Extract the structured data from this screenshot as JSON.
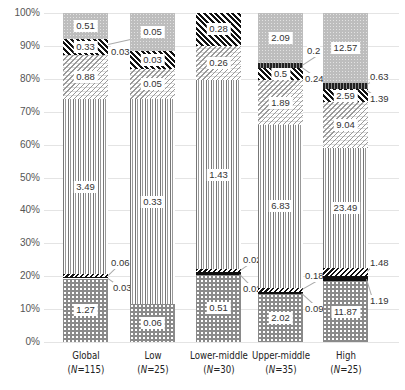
{
  "chart_data": {
    "type": "bar",
    "stacked": true,
    "normalized_percent": true,
    "title": "",
    "xlabel": "",
    "ylabel": "",
    "ylim": [
      0,
      100
    ],
    "y_ticks": [
      "0%",
      "10%",
      "20%",
      "30%",
      "40%",
      "50%",
      "60%",
      "70%",
      "80%",
      "90%",
      "100%"
    ],
    "grid": true,
    "legend": "none",
    "categories": [
      {
        "name": "Global",
        "n": "(N=115)",
        "n_prefix": "(",
        "n_italic": "N",
        "n_suffix": "=115)"
      },
      {
        "name": "Low",
        "n": "(N=25)",
        "n_prefix": "(",
        "n_italic": "N",
        "n_suffix": "=25)"
      },
      {
        "name": "Lower-middle",
        "n": "(N=30)",
        "n_prefix": "(",
        "n_italic": "N",
        "n_suffix": "=30)"
      },
      {
        "name": "Upper-middle",
        "n": "(N=35)",
        "n_prefix": "(",
        "n_italic": "N",
        "n_suffix": "=35)"
      },
      {
        "name": "High",
        "n": "(N=25)",
        "n_prefix": "(",
        "n_italic": "N",
        "n_suffix": "=25)"
      }
    ],
    "series_order_bottom_to_top": [
      "checker",
      "black",
      "thin-diagonal",
      "vertical-lines",
      "light-diagonal",
      "dense-diagonal",
      "dark-vertical",
      "dotted"
    ],
    "series": [
      {
        "name": "checker",
        "pattern": "checker",
        "values": [
          1.27,
          0.06,
          0.51,
          2.02,
          11.87
        ]
      },
      {
        "name": "black",
        "pattern": "solid-black",
        "values": [
          0.03,
          null,
          0.02,
          0.09,
          1.19
        ]
      },
      {
        "name": "thin-diagonal",
        "pattern": "thin-diagonal",
        "values": [
          0.06,
          null,
          0.02,
          0.18,
          1.48
        ]
      },
      {
        "name": "vertical-lines",
        "pattern": "vertical-lines",
        "values": [
          3.49,
          0.33,
          1.43,
          6.83,
          23.49
        ]
      },
      {
        "name": "light-diagonal",
        "pattern": "light-diagonal",
        "values": [
          0.88,
          0.05,
          0.26,
          1.89,
          9.04
        ]
      },
      {
        "name": "dense-diagonal",
        "pattern": "dense-diagonal",
        "values": [
          0.33,
          0.03,
          0.28,
          0.5,
          2.59
        ]
      },
      {
        "name": "dark-vertical",
        "pattern": "dark-vertical",
        "values": [
          null,
          null,
          null,
          0.24,
          1.39
        ]
      },
      {
        "name": "dotted",
        "pattern": "dotted",
        "values": [
          0.51,
          0.05,
          null,
          2.09,
          12.57
        ]
      }
    ],
    "side_annotations": [
      {
        "category": "Global",
        "labels": [
          "0.03",
          "0.06",
          "0.03"
        ]
      },
      {
        "category": "Lower-middle",
        "labels": [
          "0.02",
          "0.02"
        ]
      },
      {
        "category": "Upper-middle",
        "labels": [
          "0.2",
          "0.24",
          "0.18",
          "0.09"
        ]
      },
      {
        "category": "High",
        "labels": [
          "0.63",
          "1.39",
          "1.48",
          "1.19"
        ]
      }
    ]
  },
  "bars": [
    {
      "key": "global",
      "x": 63,
      "label": "Global",
      "n_prefix": "(",
      "n_italic": "N",
      "n_suffix": "=115)",
      "segments": [
        {
          "pattern": "checker",
          "from": 0,
          "to": 19.3,
          "label": "1.27"
        },
        {
          "pattern": "black",
          "from": 19.3,
          "to": 19.8,
          "label": ""
        },
        {
          "pattern": "thindiag",
          "from": 19.8,
          "to": 20.7,
          "label": ""
        },
        {
          "pattern": "vertical",
          "from": 20.7,
          "to": 73.8,
          "label": "3.49"
        },
        {
          "pattern": "lightdiag2",
          "from": 73.8,
          "to": 87.2,
          "label": "0.88"
        },
        {
          "pattern": "densediag",
          "from": 87.2,
          "to": 92.2,
          "label": "0.33"
        },
        {
          "pattern": "dotted",
          "from": 92.2,
          "to": 100,
          "label": "0.51"
        }
      ],
      "sides": [
        {
          "text": "0.03",
          "x": 111,
          "y": 88,
          "lx1": 108,
          "ly1": 90.5,
          "lx2": 130,
          "ly2": 92
        },
        {
          "text": "0.06",
          "x": 111,
          "y": 24,
          "lx1": 108,
          "ly1": 20.5,
          "lx2": 118,
          "ly2": 23.5
        },
        {
          "text": "0.03",
          "x": 113,
          "y": 16.5,
          "lx1": 108,
          "ly1": 19.6,
          "lx2": 118,
          "ly2": 17.5
        }
      ]
    },
    {
      "key": "low",
      "x": 130,
      "label": "Low",
      "n_prefix": "(",
      "n_italic": "N",
      "n_suffix": "=25)",
      "segments": [
        {
          "pattern": "checker",
          "from": 0,
          "to": 11.4,
          "label": "0.06"
        },
        {
          "pattern": "vertical",
          "from": 11.4,
          "to": 73.8,
          "label": "0.33"
        },
        {
          "pattern": "lightdiag2",
          "from": 73.8,
          "to": 83.1,
          "label": "0.05"
        },
        {
          "pattern": "densediag",
          "from": 83.1,
          "to": 88.6,
          "label": "0.03"
        },
        {
          "pattern": "dotted",
          "from": 88.6,
          "to": 100,
          "label": "0.05"
        }
      ],
      "sides": []
    },
    {
      "key": "lower-middle",
      "x": 196,
      "label": "Lower-middle",
      "n_prefix": "(",
      "n_italic": "N",
      "n_suffix": "=30)",
      "segments": [
        {
          "pattern": "checker",
          "from": 0,
          "to": 20.5,
          "label": "0.51"
        },
        {
          "pattern": "black",
          "from": 20.5,
          "to": 21.3,
          "label": ""
        },
        {
          "pattern": "thindiag",
          "from": 21.3,
          "to": 22.1,
          "label": ""
        },
        {
          "pattern": "vertical",
          "from": 22.1,
          "to": 79.6,
          "label": "1.43"
        },
        {
          "pattern": "lightdiag2",
          "from": 79.6,
          "to": 90.0,
          "label": "0.26"
        },
        {
          "pattern": "densediag",
          "from": 90.0,
          "to": 100,
          "label": "0.28"
        }
      ],
      "sides": [
        {
          "text": "0.02",
          "x": 243,
          "y": 25,
          "lx1": 240,
          "ly1": 22,
          "lx2": 252,
          "ly2": 24.5
        },
        {
          "text": "0.02",
          "x": 243,
          "y": 16,
          "lx1": 240,
          "ly1": 20.8,
          "lx2": 252,
          "ly2": 17
        }
      ]
    },
    {
      "key": "upper-middle",
      "x": 258,
      "label": "Upper-middle",
      "n_prefix": "(",
      "n_italic": "N",
      "n_suffix": "=35)",
      "segments": [
        {
          "pattern": "checker",
          "from": 0,
          "to": 14.6,
          "label": "2.02"
        },
        {
          "pattern": "black",
          "from": 14.6,
          "to": 15.2,
          "label": ""
        },
        {
          "pattern": "thindiag",
          "from": 15.2,
          "to": 16.5,
          "label": ""
        },
        {
          "pattern": "vertical",
          "from": 16.5,
          "to": 65.9,
          "label": "6.83"
        },
        {
          "pattern": "lightdiag2",
          "from": 65.9,
          "to": 79.6,
          "label": "1.89"
        },
        {
          "pattern": "densediag",
          "from": 79.6,
          "to": 83.2,
          "label": "0.5"
        },
        {
          "pattern": "darkvert",
          "from": 83.2,
          "to": 84.9,
          "label": ""
        },
        {
          "pattern": "dotted",
          "from": 84.9,
          "to": 100,
          "label": "2.09"
        }
      ],
      "sides": [
        {
          "text": "0.2",
          "x": 307,
          "y": 88.5,
          "lx1": 302,
          "ly1": 84.3,
          "lx2": 318,
          "ly2": 87.5
        },
        {
          "text": "0.24",
          "x": 305,
          "y": 80,
          "lx1": 302,
          "ly1": 83.5,
          "lx2": 316,
          "ly2": 80.5
        },
        {
          "text": "0.18",
          "x": 305,
          "y": 20,
          "lx1": 302,
          "ly1": 16,
          "lx2": 322,
          "ly2": 19.5
        },
        {
          "text": "0.09",
          "x": 305,
          "y": 10,
          "lx1": 302,
          "ly1": 14.9,
          "lx2": 316,
          "ly2": 11
        }
      ]
    },
    {
      "key": "high",
      "x": 323,
      "label": "High",
      "n_prefix": "(",
      "n_italic": "N",
      "n_suffix": "=25)",
      "segments": [
        {
          "pattern": "checker",
          "from": 0,
          "to": 18.4,
          "label": "11.87"
        },
        {
          "pattern": "black",
          "from": 18.4,
          "to": 20.2,
          "label": ""
        },
        {
          "pattern": "thindiag",
          "from": 20.2,
          "to": 22.5,
          "label": ""
        },
        {
          "pattern": "vertical",
          "from": 22.5,
          "to": 58.9,
          "label": "23.49"
        },
        {
          "pattern": "lightdiag2",
          "from": 58.9,
          "to": 72.9,
          "label": "9.04"
        },
        {
          "pattern": "densediag",
          "from": 72.9,
          "to": 76.9,
          "label": "2.59"
        },
        {
          "pattern": "darkvert",
          "from": 76.9,
          "to": 78.8,
          "label": ""
        },
        {
          "pattern": "dotted",
          "from": 78.8,
          "to": 100,
          "label": "12.57"
        }
      ],
      "sides": [
        {
          "text": "0.63",
          "x": 370,
          "y": 80.5,
          "lx1": 367,
          "ly1": 78.5,
          "lx2": 372,
          "ly2": 79.5
        },
        {
          "text": "1.39",
          "x": 370,
          "y": 74,
          "lx1": 367,
          "ly1": 76.5,
          "lx2": 372,
          "ly2": 75.5
        },
        {
          "text": "1.48",
          "x": 370,
          "y": 24,
          "lx1": 367,
          "ly1": 21.5,
          "lx2": 372,
          "ly2": 23
        },
        {
          "text": "1.19",
          "x": 370,
          "y": 12.5,
          "lx1": 367,
          "ly1": 19,
          "lx2": 372,
          "ly2": 14
        }
      ]
    }
  ],
  "axis": {
    "ticks": [
      "0%",
      "10%",
      "20%",
      "30%",
      "40%",
      "50%",
      "60%",
      "70%",
      "80%",
      "90%",
      "100%"
    ]
  }
}
